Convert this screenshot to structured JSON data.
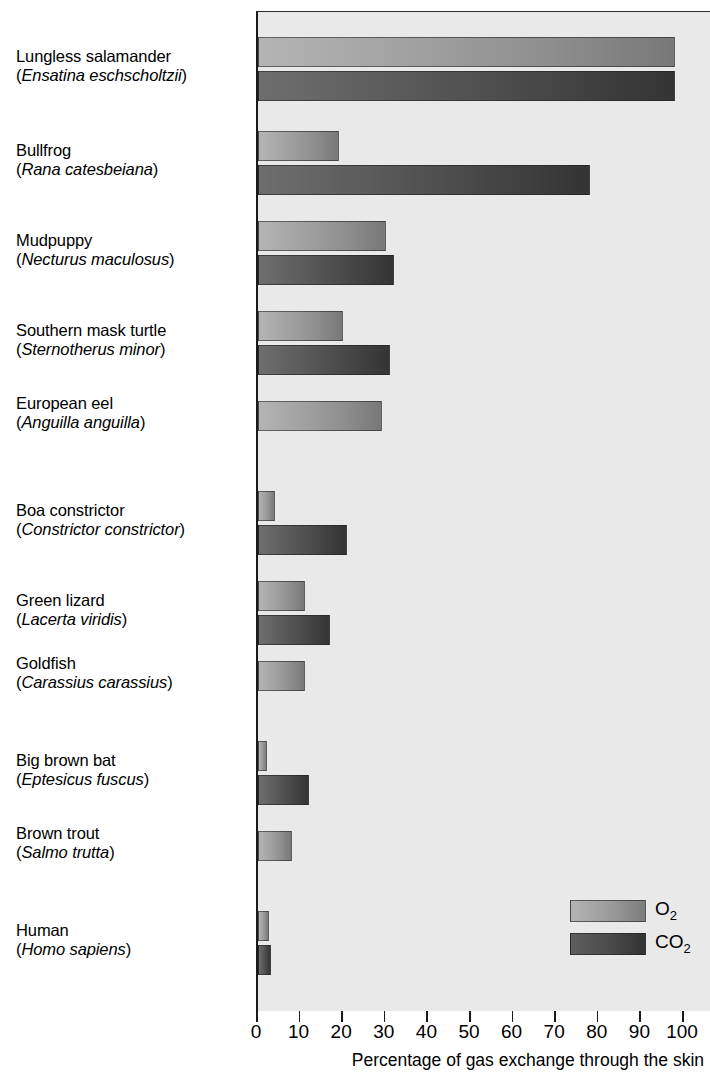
{
  "chart_data": {
    "type": "bar",
    "orientation": "horizontal",
    "title": "",
    "xlabel": "Percentage of gas exchange through the skin",
    "ylabel": "",
    "xlim": [
      0,
      100
    ],
    "xticks": [
      0,
      10,
      20,
      30,
      40,
      50,
      60,
      70,
      80,
      90,
      100
    ],
    "xtick_labels": [
      "0",
      "10",
      "20",
      "30",
      "40",
      "50",
      "60",
      "70",
      "80",
      "90",
      "100"
    ],
    "grid": false,
    "legend_position": "bottom-right",
    "categories": [
      "Lungless salamander (Ensatina eschscholtzii)",
      "Bullfrog (Rana catesbeiana)",
      "Mudpuppy (Necturus maculosus)",
      "Southern mask turtle (Sternotherus minor)",
      "European eel (Anguilla anguilla)",
      "Boa constrictor (Constrictor constrictor)",
      "Green lizard (Lacerta viridis)",
      "Goldfish (Carassius carassius)",
      "Big brown bat (Eptesicus fuscus)",
      "Brown trout (Salmo trutta)",
      "Human (Homo sapiens)"
    ],
    "series": [
      {
        "name": "O2",
        "color": "#9a9a9a",
        "values": [
          98,
          19,
          30,
          20,
          29,
          4,
          11,
          11,
          2,
          8,
          2.5
        ]
      },
      {
        "name": "CO2",
        "color": "#474747",
        "values": [
          98,
          78,
          32,
          31,
          null,
          21,
          17,
          null,
          12,
          null,
          3
        ]
      }
    ]
  },
  "species": [
    {
      "common": "Lungless salamander",
      "latin": "Ensatina eschscholtzii",
      "o2": 98,
      "co2": 98
    },
    {
      "common": "Bullfrog",
      "latin": "Rana catesbeiana",
      "o2": 19,
      "co2": 78
    },
    {
      "common": "Mudpuppy",
      "latin": "Necturus maculosus",
      "o2": 30,
      "co2": 32
    },
    {
      "common": "Southern mask turtle",
      "latin": "Sternotherus minor",
      "o2": 20,
      "co2": 31
    },
    {
      "common": "European eel",
      "latin": "Anguilla anguilla",
      "o2": 29,
      "co2": null
    },
    {
      "common": "Boa constrictor",
      "latin": "Constrictor constrictor",
      "o2": 4,
      "co2": 21
    },
    {
      "common": "Green lizard",
      "latin": "Lacerta viridis",
      "o2": 11,
      "co2": 17
    },
    {
      "common": "Goldfish",
      "latin": "Carassius carassius",
      "o2": 11,
      "co2": null
    },
    {
      "common": "Big brown bat",
      "latin": "Eptesicus fuscus",
      "o2": 2,
      "co2": 12
    },
    {
      "common": "Brown trout",
      "latin": "Salmo trutta",
      "o2": 8,
      "co2": null
    },
    {
      "common": "Human",
      "latin": "Homo sapiens",
      "o2": 2.5,
      "co2": 3
    }
  ],
  "legend": {
    "o2_label": "O",
    "o2_sub": "2",
    "co2_label": "CO",
    "co2_sub": "2"
  },
  "axis": {
    "x_title": "Percentage of gas exchange through the skin"
  }
}
